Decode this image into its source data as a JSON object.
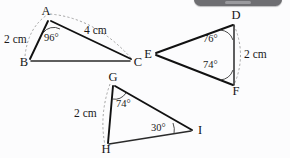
{
  "figure": {
    "caption": "Three triangles with labelled sides and angles",
    "background_color": "#fcfcfd",
    "ink_color": "#111111",
    "arc_color": "#9a9a9a"
  },
  "top_bar": {
    "name": "cropped-toolbar",
    "color": "#6e6e72"
  },
  "triangles": [
    {
      "id": "ABC",
      "vertices": [
        {
          "label": "A",
          "x": 50,
          "y": 17
        },
        {
          "label": "B",
          "x": 30,
          "y": 62
        },
        {
          "label": "C",
          "x": 133,
          "y": 62
        }
      ],
      "measures": [
        {
          "label": "2 cm",
          "x": 5,
          "y": 43,
          "side": "AB"
        },
        {
          "label": "4 cm",
          "x": 85,
          "y": 36,
          "side": "AC"
        }
      ],
      "angles": [
        {
          "label": "96°",
          "at": "A",
          "x": 48,
          "y": 38
        }
      ]
    },
    {
      "id": "DEF",
      "vertices": [
        {
          "label": "D",
          "x": 236,
          "y": 20
        },
        {
          "label": "E",
          "x": 152,
          "y": 54
        },
        {
          "label": "F",
          "x": 236,
          "y": 90
        }
      ],
      "measures": [
        {
          "label": "2 cm",
          "x": 245,
          "y": 56,
          "side": "DF"
        }
      ],
      "angles": [
        {
          "label": "76°",
          "at": "D",
          "x": 204,
          "y": 40
        },
        {
          "label": "74°",
          "at": "F",
          "x": 204,
          "y": 65
        }
      ]
    },
    {
      "id": "GHI",
      "vertices": [
        {
          "label": "G",
          "x": 112,
          "y": 82
        },
        {
          "label": "H",
          "x": 103,
          "y": 150
        },
        {
          "label": "I",
          "x": 197,
          "y": 132
        }
      ],
      "measures": [
        {
          "label": "2 cm",
          "x": 75,
          "y": 117,
          "side": "GH"
        }
      ],
      "angles": [
        {
          "label": "74°",
          "at": "G",
          "x": 117,
          "y": 104
        },
        {
          "label": "30°",
          "at": "I",
          "x": 152,
          "y": 128
        }
      ]
    }
  ]
}
